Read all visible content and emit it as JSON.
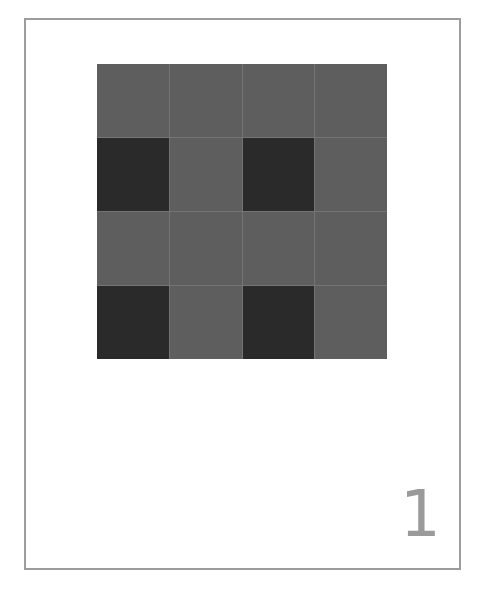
{
  "card": {
    "border_color": "#9c9c9c",
    "page_number": "1"
  },
  "grid": {
    "rows": 4,
    "cols": 4,
    "colors": {
      "gray": "#5e5e5e",
      "dark": "#2a2a2a",
      "line": "#747474"
    },
    "cells": [
      [
        "gray",
        "gray",
        "gray",
        "gray"
      ],
      [
        "dark",
        "gray",
        "dark",
        "gray"
      ],
      [
        "gray",
        "gray",
        "gray",
        "gray"
      ],
      [
        "dark",
        "gray",
        "dark",
        "gray"
      ]
    ]
  }
}
